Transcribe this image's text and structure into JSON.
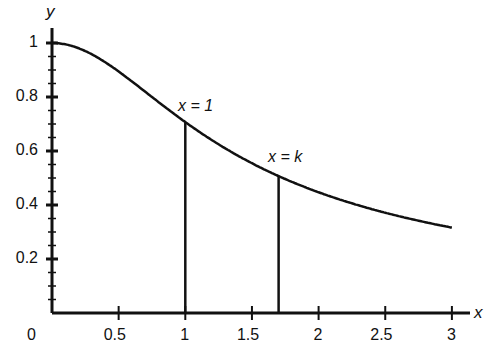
{
  "chart_data": {
    "type": "line",
    "title": "",
    "xlabel": "x",
    "ylabel": "y",
    "origin_label": "0",
    "xlim": [
      0,
      3.1
    ],
    "ylim": [
      0,
      1.05
    ],
    "x_ticks": [
      "0.5",
      "1",
      "1.5",
      "2",
      "2.5",
      "3"
    ],
    "y_ticks": [
      "0.2",
      "0.4",
      "0.6",
      "0.8",
      "1"
    ],
    "series": [
      {
        "name": "y = 1/sqrt(1+x^2)",
        "x": [
          0,
          0.5,
          1,
          1.5,
          1.7,
          2,
          2.5,
          3
        ],
        "values": [
          1.0,
          0.894,
          0.707,
          0.555,
          0.507,
          0.447,
          0.371,
          0.316
        ]
      }
    ],
    "annotations": [
      {
        "text": "x = 1",
        "x": 1,
        "y": 0.707,
        "type": "vertical-line"
      },
      {
        "text": "x = k",
        "x": 1.7,
        "y": 0.507,
        "type": "vertical-line"
      }
    ],
    "grid": false,
    "legend": "none"
  },
  "labels": {
    "x_axis": "x",
    "y_axis": "y",
    "origin": "0",
    "annot1": "x = 1",
    "annot2": "x = k"
  }
}
